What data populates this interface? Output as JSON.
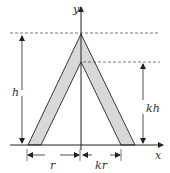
{
  "diagram": {
    "labels": {
      "y_axis": "y",
      "x_axis": "x",
      "height": "h",
      "inner_height": "kh",
      "radius": "r",
      "inner_radius": "kr"
    },
    "colors": {
      "stroke": "#222222",
      "fill": "#d8d8d8",
      "dash": "#555555"
    }
  }
}
